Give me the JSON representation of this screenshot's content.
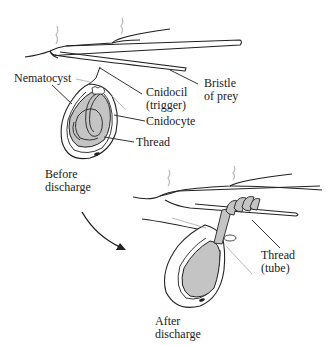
{
  "figure": {
    "colors": {
      "line": "#222222",
      "fill": "#c4c4c4",
      "leader": "#333333",
      "faint_leader": "#9a9a9a",
      "hair": "#b8b8b8",
      "background": "#ffffff"
    },
    "before_panel": {
      "labels": {
        "nematocyst": "Nematocyst",
        "cnidocil": "Cnidocil",
        "cnidocil_sub": "(trigger)",
        "bristle": "Bristle",
        "bristle_sub": "of prey",
        "cnidocyte": "Cnidocyte",
        "thread": "Thread",
        "state": "Before",
        "state_sub": "discharge"
      }
    },
    "after_panel": {
      "labels": {
        "thread": "Thread",
        "thread_sub": "(tube)",
        "state": "After",
        "state_sub": "discharge"
      }
    },
    "transition_arrow": "curved-arrow-down-right"
  }
}
